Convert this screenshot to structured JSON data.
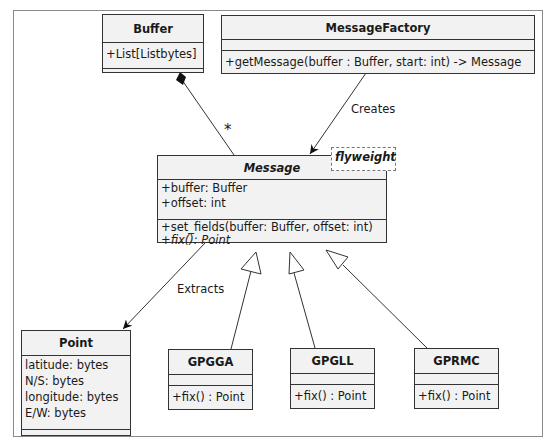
{
  "diagram": {
    "type": "UML class diagram",
    "classes": {
      "buffer": {
        "name": "Buffer",
        "attributes": [
          "+List[Listbytes]"
        ],
        "methods": []
      },
      "message_factory": {
        "name": "MessageFactory",
        "attributes": [],
        "methods": [
          "+getMessage(buffer : Buffer, start: int) -> Message"
        ]
      },
      "message": {
        "name": "Message",
        "abstract": true,
        "stereotype_note": "flyweight",
        "attributes": [
          "+buffer: Buffer",
          "+offset: int"
        ],
        "methods": [
          "+set_fields(buffer: Buffer, offset: int)",
          "+fix(): Point"
        ]
      },
      "point": {
        "name": "Point",
        "attributes": [
          "latitude: bytes",
          "N/S: bytes",
          "longitude: bytes",
          "E/W: bytes"
        ],
        "methods": []
      },
      "gpgga": {
        "name": "GPGGA",
        "attributes": [],
        "methods": [
          "+fix() : Point"
        ]
      },
      "gpgll": {
        "name": "GPGLL",
        "attributes": [],
        "methods": [
          "+fix() : Point"
        ]
      },
      "gprmc": {
        "name": "GPRMC",
        "attributes": [],
        "methods": [
          "+fix() : Point"
        ]
      }
    },
    "relations": [
      {
        "from": "Buffer",
        "to": "Message",
        "kind": "composition",
        "multiplicity": "*"
      },
      {
        "from": "MessageFactory",
        "to": "Message",
        "kind": "association",
        "label": "Creates"
      },
      {
        "from": "Message",
        "to": "Point",
        "kind": "association",
        "label": "Extracts"
      },
      {
        "from": "GPGGA",
        "to": "Message",
        "kind": "generalization"
      },
      {
        "from": "GPGLL",
        "to": "Message",
        "kind": "generalization"
      },
      {
        "from": "GPRMC",
        "to": "Message",
        "kind": "generalization"
      }
    ],
    "labels": {
      "multiplicity": "*",
      "creates": "Creates",
      "extracts": "Extracts"
    }
  }
}
